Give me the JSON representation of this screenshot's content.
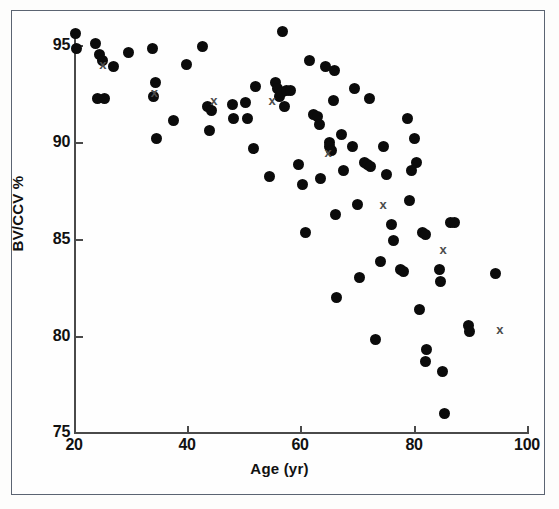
{
  "figure": {
    "background_color": "#fefefe",
    "frame_color": "#5b6472",
    "marker_color": "#0b0b0b",
    "cross_color": "#4c4c4c",
    "cross_glyph": "x"
  },
  "chart_data": {
    "type": "scatter",
    "title": "",
    "xlabel": "Age (yr)",
    "ylabel": "BV/CCV %",
    "xlim": [
      20,
      100
    ],
    "ylim": [
      75,
      95
    ],
    "xticks": [
      20,
      40,
      60,
      80,
      100
    ],
    "yticks": [
      75,
      80,
      85,
      90,
      95
    ],
    "xtick_labels": [
      "20",
      "40",
      "60",
      "80",
      "100"
    ],
    "ytick_labels": [
      "75",
      "80",
      "85",
      "90",
      "95"
    ],
    "grid": false,
    "legend": null,
    "series": [
      {
        "name": "filled-circle",
        "marker": "circle",
        "color": "#0b0b0b",
        "points": [
          [
            20.3,
            95.1
          ],
          [
            20.4,
            94.3
          ],
          [
            23.8,
            94.6
          ],
          [
            24.5,
            94.0
          ],
          [
            25.0,
            93.7
          ],
          [
            24.2,
            91.8
          ],
          [
            25.3,
            91.8
          ],
          [
            26.9,
            93.4
          ],
          [
            29.6,
            94.1
          ],
          [
            33.8,
            94.3
          ],
          [
            34.3,
            92.6
          ],
          [
            34.0,
            91.9
          ],
          [
            34.5,
            89.8
          ],
          [
            37.6,
            90.7
          ],
          [
            39.8,
            93.5
          ],
          [
            42.6,
            94.4
          ],
          [
            43.6,
            91.4
          ],
          [
            44.2,
            91.2
          ],
          [
            44.0,
            90.2
          ],
          [
            47.9,
            91.5
          ],
          [
            48.2,
            90.8
          ],
          [
            50.2,
            91.6
          ],
          [
            50.6,
            90.8
          ],
          [
            51.7,
            89.3
          ],
          [
            52.0,
            92.4
          ],
          [
            54.5,
            87.9
          ],
          [
            55.6,
            92.6
          ],
          [
            56.0,
            92.3
          ],
          [
            56.3,
            91.9
          ],
          [
            56.6,
            92.1
          ],
          [
            56.8,
            95.2
          ],
          [
            57.2,
            91.4
          ],
          [
            57.5,
            92.2
          ],
          [
            58.2,
            92.2
          ],
          [
            59.6,
            88.5
          ],
          [
            60.4,
            87.5
          ],
          [
            60.8,
            85.1
          ],
          [
            61.5,
            93.7
          ],
          [
            62.3,
            91.0
          ],
          [
            63.0,
            90.9
          ],
          [
            63.3,
            90.5
          ],
          [
            63.6,
            87.8
          ],
          [
            64.4,
            93.4
          ],
          [
            65.1,
            89.6
          ],
          [
            65.2,
            89.4
          ],
          [
            65.4,
            89.2
          ],
          [
            65.8,
            91.7
          ],
          [
            66.0,
            93.2
          ],
          [
            66.2,
            86.0
          ],
          [
            66.4,
            81.8
          ],
          [
            67.3,
            90.0
          ],
          [
            67.5,
            88.2
          ],
          [
            69.2,
            89.4
          ],
          [
            69.6,
            92.3
          ],
          [
            70.0,
            86.5
          ],
          [
            70.4,
            82.8
          ],
          [
            71.3,
            88.6
          ],
          [
            71.8,
            88.5
          ],
          [
            72.1,
            91.8
          ],
          [
            72.4,
            88.4
          ],
          [
            73.2,
            79.7
          ],
          [
            74.2,
            83.6
          ],
          [
            74.6,
            89.4
          ],
          [
            75.2,
            88.0
          ],
          [
            76.0,
            85.5
          ],
          [
            76.5,
            84.7
          ],
          [
            77.6,
            83.2
          ],
          [
            78.1,
            83.1
          ],
          [
            78.8,
            90.8
          ],
          [
            79.2,
            86.7
          ],
          [
            79.6,
            88.2
          ],
          [
            80.1,
            89.8
          ],
          [
            80.4,
            88.6
          ],
          [
            81.0,
            81.2
          ],
          [
            81.6,
            85.1
          ],
          [
            82.1,
            85.0
          ],
          [
            82.3,
            79.2
          ],
          [
            82.0,
            78.6
          ],
          [
            84.5,
            83.2
          ],
          [
            84.8,
            82.6
          ],
          [
            85.0,
            78.1
          ],
          [
            85.4,
            76.0
          ],
          [
            86.4,
            85.6
          ],
          [
            87.2,
            85.6
          ],
          [
            89.6,
            80.4
          ],
          [
            89.8,
            80.1
          ],
          [
            94.4,
            83.0
          ]
        ]
      },
      {
        "name": "cross",
        "marker": "x",
        "color": "#4c4c4c",
        "points": [
          [
            25.1,
            93.5
          ],
          [
            34.2,
            92.1
          ],
          [
            44.7,
            91.7
          ],
          [
            55.0,
            91.7
          ],
          [
            64.9,
            89.1
          ],
          [
            74.6,
            86.5
          ],
          [
            85.2,
            84.2
          ],
          [
            95.2,
            80.2
          ]
        ]
      }
    ]
  }
}
